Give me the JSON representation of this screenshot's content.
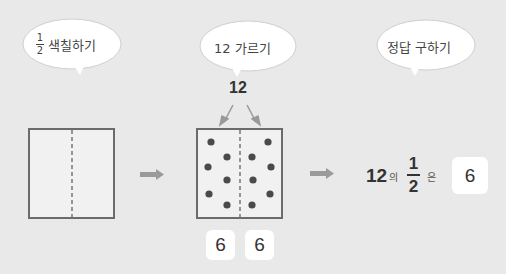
{
  "bubbles": [
    {
      "id": "shade-half",
      "fraction": {
        "numerator": "1",
        "denominator": "2"
      },
      "text": "색칠하기"
    },
    {
      "id": "divide-12",
      "text": "12 가르기"
    },
    {
      "id": "find-answer",
      "text": "정답 구하기"
    }
  ],
  "divide_total": "12",
  "split_boxes": [
    "6",
    "6"
  ],
  "result": {
    "whole": "12",
    "particle_of": "의",
    "fraction": {
      "numerator": "1",
      "denominator": "2"
    },
    "particle_is": "은",
    "answer": "6"
  },
  "colors": {
    "background": "#e9e9e9",
    "box_border": "#6b6b6b",
    "box_fill": "#f1f1f1",
    "dot": "#4a4a4a",
    "arrow": "#9a9a9a"
  }
}
